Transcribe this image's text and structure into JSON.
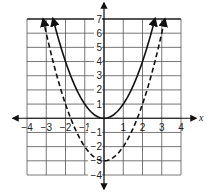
{
  "chart_data": {
    "type": "line",
    "title": "",
    "xlabel": "x",
    "ylabel": "y",
    "xlim": [
      -4,
      4
    ],
    "ylim": [
      -4,
      7
    ],
    "grid": true,
    "x_ticks": [
      "-4",
      "-3",
      "-2",
      "-1",
      "1",
      "2",
      "3",
      "4"
    ],
    "y_ticks": [
      "7",
      "6",
      "5",
      "4",
      "3",
      "2",
      "1",
      "-1",
      "-2",
      "-3",
      "-4"
    ],
    "series": [
      {
        "name": "y = x^2",
        "style": "solid",
        "x": [
          -2.65,
          -2,
          -1,
          0,
          1,
          2,
          2.65
        ],
        "y": [
          7,
          4,
          1,
          0,
          1,
          4,
          7
        ]
      },
      {
        "name": "y = x^2 - 3",
        "style": "dashed",
        "x": [
          -3.16,
          -3,
          -2,
          -1,
          0,
          1,
          2,
          3,
          3.16
        ],
        "y": [
          7,
          6,
          1,
          -2,
          -3,
          -2,
          1,
          6,
          7
        ]
      }
    ]
  }
}
